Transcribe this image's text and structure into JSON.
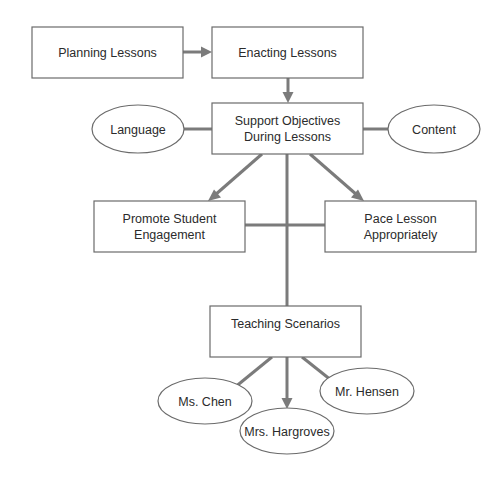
{
  "diagram": {
    "type": "flowchart",
    "colors": {
      "background": "#ffffff",
      "box_border": "#6b6b6b",
      "connector": "#7b7b7b",
      "text": "#2b2b2b"
    },
    "nodes": {
      "planning": {
        "shape": "rectangle",
        "line1": "Planning Lessons"
      },
      "enacting": {
        "shape": "rectangle",
        "line1": "Enacting Lessons"
      },
      "support": {
        "shape": "rectangle",
        "line1": "Support Objectives",
        "line2": "During Lessons"
      },
      "language": {
        "shape": "ellipse",
        "line1": "Language"
      },
      "content": {
        "shape": "ellipse",
        "line1": "Content"
      },
      "engagement": {
        "shape": "rectangle",
        "line1": "Promote Student",
        "line2": "Engagement"
      },
      "pace": {
        "shape": "rectangle",
        "line1": "Pace Lesson",
        "line2": "Appropriately"
      },
      "scenarios": {
        "shape": "rectangle",
        "line1": "Teaching Scenarios"
      },
      "chen": {
        "shape": "ellipse",
        "line1": "Ms. Chen"
      },
      "hargroves": {
        "shape": "ellipse",
        "line1": "Mrs. Hargroves"
      },
      "hensen": {
        "shape": "ellipse",
        "line1": "Mr. Hensen"
      }
    },
    "edges": [
      {
        "from": "Planning Lessons",
        "to": "Enacting Lessons",
        "type": "arrow"
      },
      {
        "from": "Enacting Lessons",
        "to": "Support Objectives During Lessons",
        "type": "arrow"
      },
      {
        "from": "Language",
        "to": "Support Objectives During Lessons",
        "type": "line"
      },
      {
        "from": "Support Objectives During Lessons",
        "to": "Content",
        "type": "line"
      },
      {
        "from": "Support Objectives During Lessons",
        "to": "Promote Student Engagement",
        "type": "arrow"
      },
      {
        "from": "Support Objectives During Lessons",
        "to": "Pace Lesson Appropriately",
        "type": "arrow"
      },
      {
        "from": "Promote Student Engagement",
        "to": "Pace Lesson Appropriately",
        "type": "line"
      },
      {
        "from": "Support Objectives During Lessons",
        "to": "Teaching Scenarios",
        "type": "line"
      },
      {
        "from": "Teaching Scenarios",
        "to": "Ms. Chen",
        "type": "arrow"
      },
      {
        "from": "Teaching Scenarios",
        "to": "Mrs. Hargroves",
        "type": "arrow"
      },
      {
        "from": "Teaching Scenarios",
        "to": "Mr. Hensen",
        "type": "arrow"
      }
    ]
  }
}
